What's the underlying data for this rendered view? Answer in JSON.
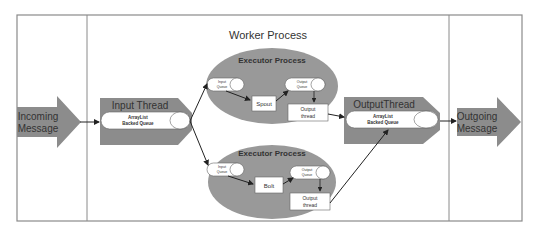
{
  "diagram": {
    "title": "Worker Process",
    "incoming": {
      "line1": "Incoming",
      "line2": "Message"
    },
    "outgoing": {
      "line1": "Outgoing",
      "line2": "Message"
    },
    "input_thread": {
      "title": "Input Thread",
      "queue_line1": "ArrayList",
      "queue_line2": "Backed Queue"
    },
    "output_thread": {
      "title": "OutputThread",
      "queue_line1": "ArrayList",
      "queue_line2": "Backed Queue"
    },
    "executors": [
      {
        "title": "Executor Process",
        "input_queue": {
          "line1": "Input",
          "line2": "Queue"
        },
        "component": "Spout",
        "output_queue": {
          "line1": "Output",
          "line2": "Queue"
        },
        "output_thread": {
          "line1": "Output",
          "line2": "thread"
        }
      },
      {
        "title": "Executor Process",
        "input_queue": {
          "line1": "Input",
          "line2": "Queue"
        },
        "component": "Bolt",
        "output_queue": {
          "line1": "Output",
          "line2": "Queue"
        },
        "output_thread": {
          "line1": "Output",
          "line2": "thread"
        }
      }
    ],
    "colors": {
      "shape_fill": "#8c8c8c",
      "ellipse_fill": "#999999",
      "frame": "#8a8a8a",
      "arrow": "#222222"
    }
  }
}
